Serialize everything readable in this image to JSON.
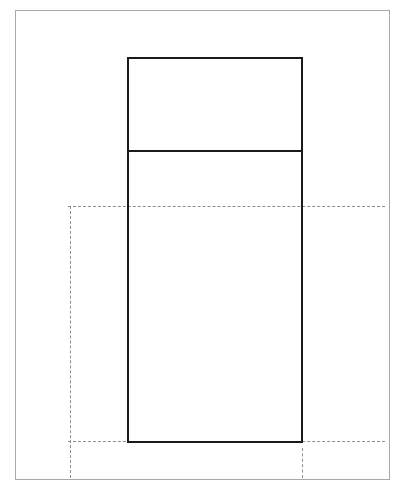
{
  "figure": {
    "background_color": "#ffffff",
    "width_px": 405,
    "height_px": 491,
    "frame": {
      "name": "sheet border",
      "color": "#a8a8a8",
      "x": 15,
      "y": 10,
      "width": 375,
      "height": 470,
      "stroke_px": 1,
      "style": "solid"
    },
    "shapes": [
      {
        "name": "body-outline",
        "type": "rectangle",
        "color": "#1a1a1a",
        "x": 127,
        "y": 57,
        "width": 176,
        "height": 386,
        "stroke_px": 2,
        "style": "solid"
      },
      {
        "name": "body-divider",
        "type": "horizontal-line",
        "color": "#1a1a1a",
        "x1": 127,
        "x2": 303,
        "y": 150,
        "stroke_px": 2,
        "style": "solid"
      }
    ],
    "construction_lines": [
      {
        "name": "upper-reference-level",
        "type": "horizontal-line",
        "color": "#8c8c8c",
        "x1": 68,
        "x2": 385,
        "y": 206,
        "stroke_px": 1.5,
        "style": "dash-dot"
      },
      {
        "name": "lower-reference-level",
        "type": "horizontal-line",
        "color": "#8f8f8f",
        "x1": 68,
        "x2": 385,
        "y": 441,
        "stroke_px": 1.2,
        "style": "dashed"
      },
      {
        "name": "left-extension-line",
        "type": "vertical-line",
        "color": "#8f8f8f",
        "x": 70,
        "y1": 206,
        "y2": 478,
        "stroke_px": 1.2,
        "style": "dashed"
      },
      {
        "name": "right-extension-line",
        "type": "vertical-line",
        "color": "#8f8f8f",
        "x": 302,
        "y1": 448,
        "y2": 478,
        "stroke_px": 1.2,
        "style": "dashed"
      }
    ],
    "labels": []
  }
}
